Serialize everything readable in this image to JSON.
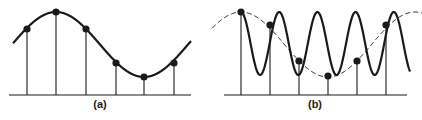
{
  "panels": [
    {
      "id": "a",
      "caption": "(a)",
      "description": "Slow sinusoid sampled at regular intervals",
      "baseline": {
        "y": 95,
        "x1": 9,
        "x2": 191
      },
      "curve": {
        "type": "sine",
        "x_start": 13,
        "x_end": 191,
        "peak_x": 56,
        "peak_y": 12,
        "trough_x": 144,
        "trough_y": 77
      },
      "samples": [
        {
          "x": 27,
          "y": 29
        },
        {
          "x": 56,
          "y": 12
        },
        {
          "x": 86,
          "y": 29
        },
        {
          "x": 116,
          "y": 63
        },
        {
          "x": 144,
          "y": 77
        },
        {
          "x": 174,
          "y": 63
        }
      ]
    },
    {
      "id": "b",
      "caption": "(b)",
      "description": "Fast sinusoid sampled at same intervals; samples fall on an aliased slow sinusoid (dashed)",
      "baseline": {
        "y": 95,
        "x1": 224,
        "x2": 407
      },
      "fast_curve": {
        "type": "sine",
        "x_start": 241,
        "x_end": 410,
        "first_peak_x": 241,
        "period": 38.2,
        "top_y": 12,
        "bottom_y": 75
      },
      "alias_curve": {
        "type": "sine",
        "style": "dashed",
        "x_start": 212,
        "x_end": 422,
        "peak_x": 241,
        "top_y": 12,
        "bottom_y": 77,
        "period": 174
      },
      "samples": [
        {
          "x": 241,
          "y": 12
        },
        {
          "x": 270,
          "y": 25
        },
        {
          "x": 299,
          "y": 61
        },
        {
          "x": 328,
          "y": 76
        },
        {
          "x": 357,
          "y": 61
        },
        {
          "x": 386,
          "y": 25
        }
      ]
    }
  ],
  "colors": {
    "stroke": "#1a1a1a",
    "background": "#ffffff"
  }
}
